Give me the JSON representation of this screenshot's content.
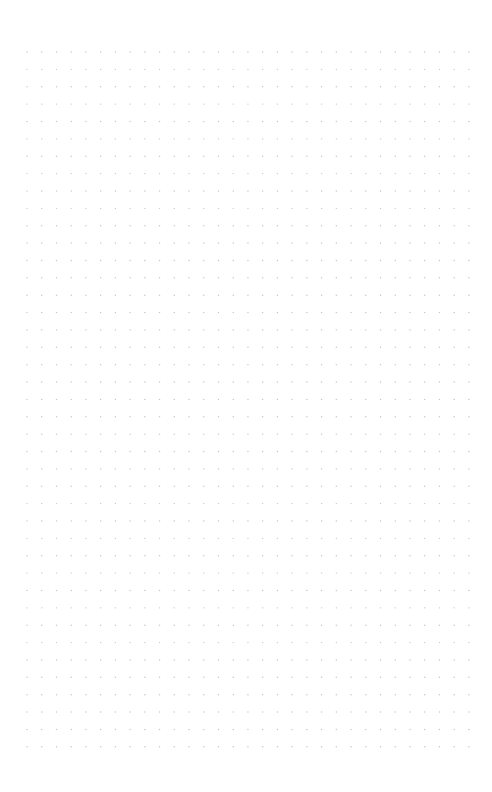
{
  "page": {
    "width": 492,
    "height": 792,
    "background": "#ffffff"
  },
  "dot_grid": {
    "origin_x": 27,
    "origin_y": 52,
    "spacing_x": 14.73,
    "spacing_y": 17.37,
    "columns": 31,
    "rows": 41,
    "dot_radius": 0.7,
    "dot_color": "#c4c4c4"
  }
}
